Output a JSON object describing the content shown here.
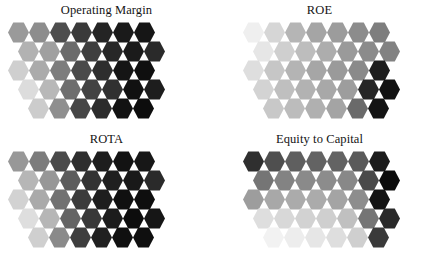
{
  "figure": {
    "type": "som-component-planes",
    "background": "#ffffff",
    "width": 426,
    "height": 258,
    "colormap": "grayscale-light-to-dark",
    "grid": {
      "rows": 5,
      "row_lengths": [
        7,
        7,
        7,
        7,
        6
      ],
      "row_offsets_px": [
        0,
        10,
        0,
        10,
        20
      ],
      "cell_shape": "hexagon",
      "cell_size_px": 21
    }
  },
  "panels": [
    {
      "id": "operating-margin",
      "title": "Operating Margin",
      "rows": [
        [
          "#9a9a9a",
          "#8d8d8d",
          "#4e4e4e",
          "#3a3a3a",
          "#242424",
          "#1a1a1a",
          "#161616"
        ],
        [
          "#b2b2b2",
          "#a0a0a0",
          "#6b6b6b",
          "#3f3f3f",
          "#272727",
          "#1b1b1b",
          "#2a2a2a"
        ],
        [
          "#cfcfcf",
          "#ababab",
          "#7d7d7d",
          "#4a4a4a",
          "#2e2e2e",
          "#151515",
          "#0f0f0f"
        ],
        [
          "#dcdcdc",
          "#b8b8b8",
          "#6e6e6e",
          "#424242",
          "#303030",
          "#111111",
          "#1d1d1d"
        ],
        [
          "#cccccc",
          "#8f8f8f",
          "#464646",
          "#2c2c2c",
          "#121212",
          "#0d0d0d"
        ]
      ]
    },
    {
      "id": "roe",
      "title": "ROE",
      "rows": [
        [
          "#efefef",
          "#d6d6d6",
          "#b5b5b5",
          "#a5a5a5",
          "#9c9c9c",
          "#8c8c8c",
          "#7e7e7e"
        ],
        [
          "#e6e6e6",
          "#cfcfcf",
          "#bdbdbd",
          "#adadad",
          "#9a9a9a",
          "#8b8b8b",
          "#828282"
        ],
        [
          "#dedede",
          "#c6c6c6",
          "#b4b4b4",
          "#a6a6a6",
          "#9a9a9a",
          "#8a8a8a",
          "#1e1e1e"
        ],
        [
          "#d3d3d3",
          "#bfbfbf",
          "#b2b2b2",
          "#a8a8a8",
          "#9d9d9d",
          "#262626",
          "#121212"
        ],
        [
          "#c8c8c8",
          "#bcbcbc",
          "#b0b0b0",
          "#a4a4a4",
          "#6a6a6a",
          "#141414"
        ]
      ]
    },
    {
      "id": "rota",
      "title": "ROTA",
      "rows": [
        [
          "#989898",
          "#7c7c7c",
          "#4a4a4a",
          "#2e2e2e",
          "#1d1d1d",
          "#131313",
          "#171717"
        ],
        [
          "#b6b6b6",
          "#979797",
          "#5c5c5c",
          "#333333",
          "#1f1f1f",
          "#191919",
          "#2a2a2a"
        ],
        [
          "#d2d2d2",
          "#aaaaaa",
          "#717171",
          "#3b3b3b",
          "#1e1e1e",
          "#101010",
          "#0e0e0e"
        ],
        [
          "#dedede",
          "#b6b6b6",
          "#646464",
          "#383838",
          "#1c1c1c",
          "#0d0d0d",
          "#161616"
        ],
        [
          "#cfcfcf",
          "#8a8a8a",
          "#3e3e3e",
          "#202020",
          "#101010",
          "#0f0f0f"
        ]
      ]
    },
    {
      "id": "equity-capital",
      "title": "Equity to Capital",
      "rows": [
        [
          "#2f2f2f",
          "#4f4f4f",
          "#5f5f5f",
          "#636363",
          "#636363",
          "#5a5a5a",
          "#1c1c1c"
        ],
        [
          "#757575",
          "#838383",
          "#8a8a8a",
          "#8c8c8c",
          "#888888",
          "#4a4a4a",
          "#0c0c0c"
        ],
        [
          "#9d9d9d",
          "#a8a8a8",
          "#ababab",
          "#ababab",
          "#a4a4a4",
          "#8d8d8d",
          "#141414"
        ],
        [
          "#dedede",
          "#d8d8d8",
          "#d2d2d2",
          "#cfcfcf",
          "#c0c0c0",
          "#757575",
          "#2a2a2a"
        ],
        [
          "#f2f2f2",
          "#ededed",
          "#e6e6e6",
          "#dedede",
          "#cfcfcf",
          "#3a3a3a"
        ]
      ]
    }
  ]
}
